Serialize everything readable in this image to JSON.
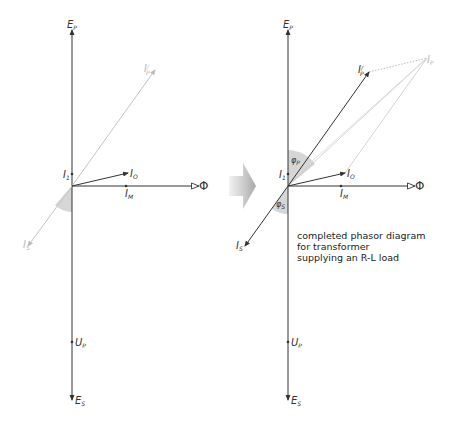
{
  "left_diagram": {
    "title": "partial phasor diagram",
    "labels": {
      "ep": "E",
      "ep_sub": "P",
      "ipprime": "I",
      "ipprime_sup": "/",
      "ipprime_sub": "P",
      "i1": "I",
      "i1_sub": "1",
      "i0": "I",
      "i0_sub": "O",
      "im": "I",
      "im_sub": "M",
      "phi": "Φ",
      "is": "I",
      "is_sub": "S",
      "up": "U",
      "up_sub": "P",
      "es": "E",
      "es_sub": "S"
    }
  },
  "arrow": {
    "label": "transition-arrow"
  },
  "right_diagram": {
    "labels": {
      "ep": "E",
      "ep_sub": "P",
      "ipprime": "I",
      "ipprime_sup": "/",
      "ipprime_sub": "P",
      "ip": "I",
      "ip_sub": "P",
      "i1": "I",
      "i1_sub": "1",
      "i0": "I",
      "i0_sub": "O",
      "im": "I",
      "im_sub": "M",
      "phi": "Φ",
      "phip": "φ",
      "phip_sub": "P",
      "phis": "φ",
      "phis_sub": "S",
      "is": "I",
      "is_sub": "S",
      "up": "U",
      "up_sub": "P",
      "es": "E",
      "es_sub": "S"
    },
    "caption": {
      "line1": "completed phasor diagram",
      "line2": "for transformer",
      "line3": "supplying an R-L load"
    }
  }
}
